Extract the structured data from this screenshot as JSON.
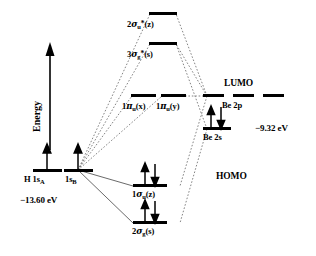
{
  "diagram": {
    "axis": {
      "energy_label": "Energy",
      "icon": "up-arrow-icon"
    },
    "left_fragment": {
      "level_a_label": "H 1s",
      "level_a_sub": "A",
      "level_b_label": "1s",
      "level_b_sub": "B",
      "energy_value": "−13.60 eV",
      "electrons_a": 1,
      "electrons_b": 1
    },
    "right_fragment": {
      "p_label": "Be 2p",
      "s_label": "Be 2s",
      "lumo_label": "LUMO",
      "energy_value": "−9.32 eV",
      "p_count": 3,
      "s_electrons": 2
    },
    "molecular_orbitals": [
      {
        "name": "2sigma-u-star-z",
        "prefix": "2",
        "greek": "σ",
        "sub": "u",
        "star": "*",
        "paren": "(z)",
        "electrons": 0
      },
      {
        "name": "3sigma-g-star-s",
        "prefix": "3",
        "greek": "σ",
        "sub": "g",
        "star": "*",
        "paren": "(s)",
        "electrons": 0
      },
      {
        "name": "1pi-u-x",
        "prefix": "1",
        "greek": "π",
        "sub": "u",
        "star": "",
        "paren": "(x)",
        "electrons": 0
      },
      {
        "name": "1pi-u-y",
        "prefix": "1",
        "greek": "π",
        "sub": "u",
        "star": "",
        "paren": "(y)",
        "electrons": 0
      },
      {
        "name": "1sigma-u-z",
        "prefix": "1",
        "greek": "σ",
        "sub": "u",
        "star": "",
        "paren": "(z)",
        "electrons": 2
      },
      {
        "name": "2sigma-g-s",
        "prefix": "2",
        "greek": "σ",
        "sub": "g",
        "star": "",
        "paren": "(s)",
        "electrons": 2
      }
    ],
    "annotations": {
      "homo": "HOMO",
      "lumo": "LUMO"
    },
    "colors": {
      "level_line": "#000000",
      "correlation_line": "#555555",
      "background": "#ffffff"
    }
  }
}
